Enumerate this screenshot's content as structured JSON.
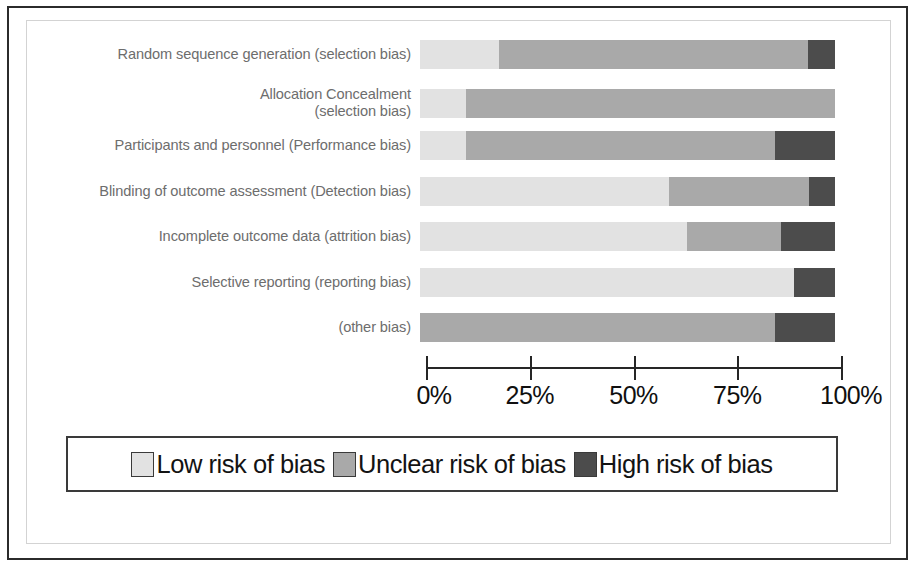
{
  "chart_data": {
    "type": "bar",
    "subtype": "stacked-horizontal-percent",
    "title": "",
    "xlabel": "",
    "ylabel": "",
    "xlim": [
      0,
      100
    ],
    "xticks": [
      "0%",
      "25%",
      "50%",
      "75%",
      "100%"
    ],
    "xtick_values": [
      0,
      25,
      50,
      75,
      100
    ],
    "grid": false,
    "legend_position": "bottom",
    "categories": [
      "Random sequence generation (selection bias)",
      "Allocation Concealment\n(selection bias)",
      "Participants and personnel (Performance bias)",
      "Blinding of outcome assessment (Detection bias)",
      "Incomplete outcome data (attrition bias)",
      "Selective reporting (reporting bias)",
      "(other bias)"
    ],
    "series": [
      {
        "name": "Low risk of bias",
        "color": "#e2e2e2",
        "values": [
          19,
          11,
          11,
          60,
          64.3,
          90,
          0
        ]
      },
      {
        "name": "Unclear risk of bias",
        "color": "#a9a9a9",
        "values": [
          74.5,
          89,
          74.5,
          33.7,
          22.7,
          0,
          85.5
        ]
      },
      {
        "name": "High risk of bias",
        "color": "#4c4c4c",
        "values": [
          6.5,
          0,
          14.5,
          6.3,
          13,
          10,
          14.5
        ]
      }
    ]
  },
  "legend": {
    "items": [
      {
        "label": "Low risk of bias",
        "color": "#e2e2e2"
      },
      {
        "label": "Unclear risk of bias",
        "color": "#a9a9a9"
      },
      {
        "label": "High risk of bias",
        "color": "#4c4c4c"
      }
    ]
  }
}
